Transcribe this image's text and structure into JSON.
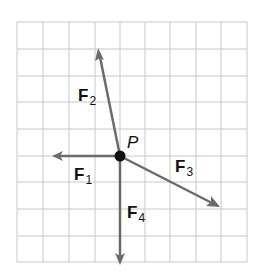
{
  "diagram": {
    "type": "force-vector-diagram",
    "grid": {
      "columns": 9,
      "rows": 9,
      "line_color": "#c8c8c8"
    },
    "point": {
      "label": "P",
      "color": "#111111"
    },
    "vector_color": "#6b6b6b",
    "vectors": [
      {
        "id": "F1",
        "letter": "F",
        "subscript": "1",
        "direction": "left"
      },
      {
        "id": "F2",
        "letter": "F",
        "subscript": "2",
        "direction": "up-left"
      },
      {
        "id": "F3",
        "letter": "F",
        "subscript": "3",
        "direction": "down-right"
      },
      {
        "id": "F4",
        "letter": "F",
        "subscript": "4",
        "direction": "down"
      }
    ]
  }
}
